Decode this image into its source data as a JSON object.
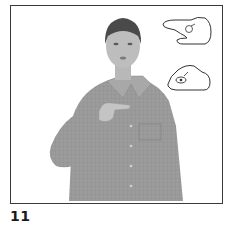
{
  "figure": {
    "number": "11",
    "colors": {
      "frame_border": "#3a3a3a",
      "shirt": "#9a9a9a",
      "skin": "#b8b8b8",
      "hair": "#4a4a4a",
      "background": "#ffffff"
    }
  },
  "handshapes": [
    {
      "name": "handshape-top",
      "label": "extended index finger, flat hand"
    },
    {
      "name": "handshape-bottom",
      "label": "index and thumb pinch"
    }
  ]
}
